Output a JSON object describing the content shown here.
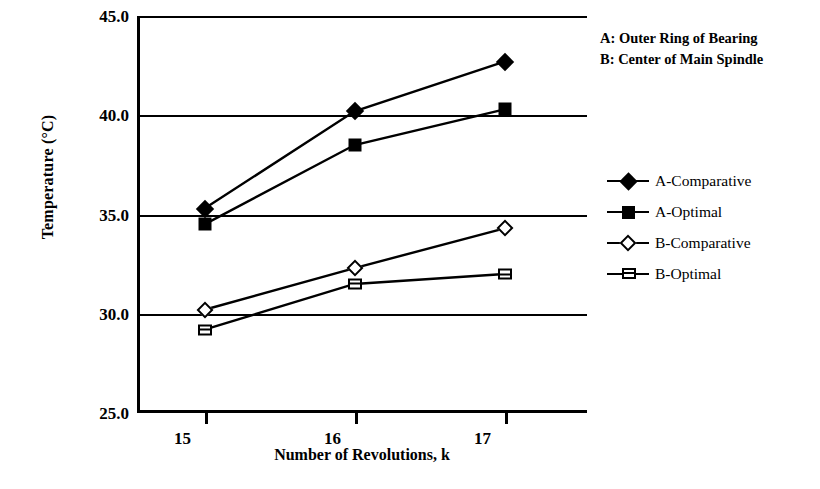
{
  "chart_data": {
    "type": "line",
    "title": "",
    "xlabel": "Number of Revolutions, k",
    "ylabel": "Temperature (°C)",
    "x": [
      15,
      16,
      17
    ],
    "xtick_labels": [
      "15",
      "16",
      "17"
    ],
    "ytick_labels": [
      "45.0",
      "40.0",
      "35.0",
      "30.0",
      "25.0"
    ],
    "ytick_values": [
      45.0,
      40.0,
      35.0,
      30.0,
      25.0
    ],
    "xlim": [
      14.55,
      17.55
    ],
    "ylim": [
      25.0,
      45.0
    ],
    "grid": "horizontal",
    "legend_position": "right",
    "series": [
      {
        "name": "A-Comparative",
        "marker": "filled-diamond",
        "values": [
          35.3,
          40.2,
          42.7
        ]
      },
      {
        "name": "A-Optimal",
        "marker": "filled-square",
        "values": [
          34.5,
          38.5,
          40.3
        ]
      },
      {
        "name": "B-Comparative",
        "marker": "open-diamond",
        "values": [
          30.2,
          32.3,
          34.3
        ]
      },
      {
        "name": "B-Optimal",
        "marker": "open-square",
        "values": [
          29.2,
          31.5,
          32.0
        ]
      }
    ],
    "annotations": [
      "A: Outer Ring of Bearing",
      "B: Center of Main Spindle"
    ]
  },
  "colors": {
    "ink": "#000000",
    "background": "#ffffff"
  }
}
